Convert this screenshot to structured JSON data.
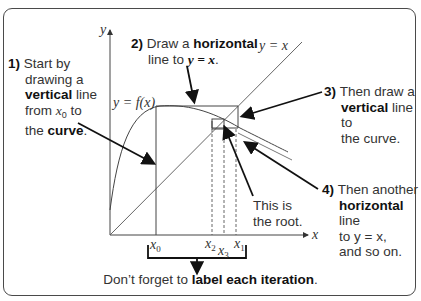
{
  "notes": {
    "step1": {
      "num": "1)",
      "line1": "Start by",
      "line2": "drawing a",
      "bold3": "vertical",
      "line3": " line",
      "line4a": "from ",
      "var": "x",
      "sub": "0",
      "line4b": " to",
      "line5a": "the ",
      "bold5": "curve",
      "line5b": "."
    },
    "step2": {
      "num": "2)",
      "line1a": "Draw a ",
      "bold1": "horizontal",
      "line2a": "line to ",
      "bold2": "y = x",
      "line2b": "."
    },
    "step3": {
      "num": "3)",
      "line1": "Then draw a",
      "bold2": "vertical",
      "line2": " line to",
      "line3": "the curve."
    },
    "step4": {
      "num": "4)",
      "line1": "Then another",
      "bold2": "horizontal",
      "line2": " line",
      "line3": "to y = x,",
      "line4": "and so on."
    },
    "root": {
      "line1": "This is",
      "line2": "the root."
    }
  },
  "labels": {
    "y_axis": "y",
    "x_axis": "x",
    "curve": "y = f(x)",
    "line": "y = x",
    "x0": {
      "var": "x",
      "sub": "0"
    },
    "x1": {
      "var": "x",
      "sub": "1"
    },
    "x2": {
      "var": "x",
      "sub": "2"
    },
    "x3": {
      "var": "x",
      "sub": "3"
    }
  },
  "footer": {
    "pre": "Don’t forget to ",
    "bold": "label each iteration",
    "post": "."
  }
}
